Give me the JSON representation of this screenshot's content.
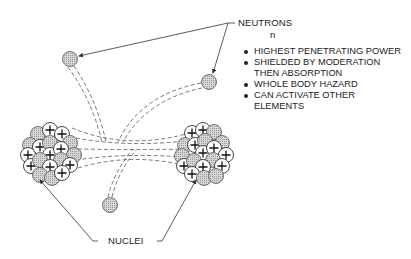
{
  "labels": {
    "neutrons": "NEUTRONS",
    "symbol": "n",
    "nuclei": "NUCLEI"
  },
  "properties": [
    "HIGHEST PENETRATING POWER",
    "SHIELDED BY MODERATION",
    "THEN ABSORPTION",
    "WHOLE BODY HAZARD",
    "CAN ACTIVATE OTHER",
    "ELEMENTS"
  ],
  "colors": {
    "line": "#444444",
    "neutron_fill": "#c8c8c8",
    "proton_fill": "#ffffff"
  }
}
